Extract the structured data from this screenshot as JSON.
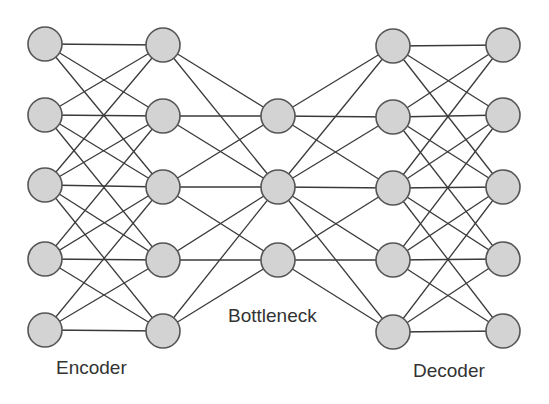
{
  "diagram": {
    "labels": {
      "encoder": "Encoder",
      "bottleneck": "Bottleneck",
      "decoder": "Decoder"
    },
    "style": {
      "node_fill": "#d3d3d3",
      "node_stroke": "#555555",
      "edge_color": "#3a3a3a",
      "node_radius": 17,
      "text_color": "#333333"
    },
    "layers": [
      {
        "name": "input",
        "x": 45,
        "ys": [
          44,
          115,
          185,
          259,
          330
        ]
      },
      {
        "name": "encoder-hidden",
        "x": 163,
        "ys": [
          45,
          116,
          187,
          260,
          331
        ]
      },
      {
        "name": "bottleneck",
        "x": 278,
        "ys": [
          116,
          187,
          260
        ]
      },
      {
        "name": "decoder-hidden",
        "x": 393,
        "ys": [
          46,
          117,
          188,
          260,
          332
        ]
      },
      {
        "name": "output",
        "x": 503,
        "ys": [
          45,
          115,
          187,
          259,
          331
        ]
      }
    ],
    "connections": [
      [
        [
          0,
          0
        ],
        [
          0,
          1
        ],
        [
          0,
          2
        ],
        [
          1,
          0
        ],
        [
          1,
          1
        ],
        [
          1,
          2
        ],
        [
          1,
          3
        ],
        [
          2,
          0
        ],
        [
          2,
          1
        ],
        [
          2,
          2
        ],
        [
          2,
          3
        ],
        [
          2,
          4
        ],
        [
          3,
          1
        ],
        [
          3,
          2
        ],
        [
          3,
          3
        ],
        [
          3,
          4
        ],
        [
          4,
          2
        ],
        [
          4,
          3
        ],
        [
          4,
          4
        ]
      ],
      [
        [
          0,
          0
        ],
        [
          0,
          1
        ],
        [
          1,
          0
        ],
        [
          1,
          1
        ],
        [
          2,
          0
        ],
        [
          2,
          1
        ],
        [
          2,
          2
        ],
        [
          3,
          1
        ],
        [
          3,
          2
        ],
        [
          4,
          1
        ],
        [
          4,
          2
        ]
      ],
      [
        [
          0,
          0
        ],
        [
          0,
          1
        ],
        [
          0,
          2
        ],
        [
          1,
          0
        ],
        [
          1,
          1
        ],
        [
          1,
          2
        ],
        [
          1,
          3
        ],
        [
          1,
          4
        ],
        [
          2,
          2
        ],
        [
          2,
          3
        ],
        [
          2,
          4
        ]
      ],
      [
        [
          0,
          0
        ],
        [
          0,
          1
        ],
        [
          0,
          2
        ],
        [
          1,
          0
        ],
        [
          1,
          1
        ],
        [
          1,
          2
        ],
        [
          1,
          3
        ],
        [
          2,
          0
        ],
        [
          2,
          1
        ],
        [
          2,
          2
        ],
        [
          2,
          3
        ],
        [
          2,
          4
        ],
        [
          3,
          1
        ],
        [
          3,
          2
        ],
        [
          3,
          3
        ],
        [
          3,
          4
        ],
        [
          4,
          2
        ],
        [
          4,
          3
        ],
        [
          4,
          4
        ]
      ]
    ]
  }
}
